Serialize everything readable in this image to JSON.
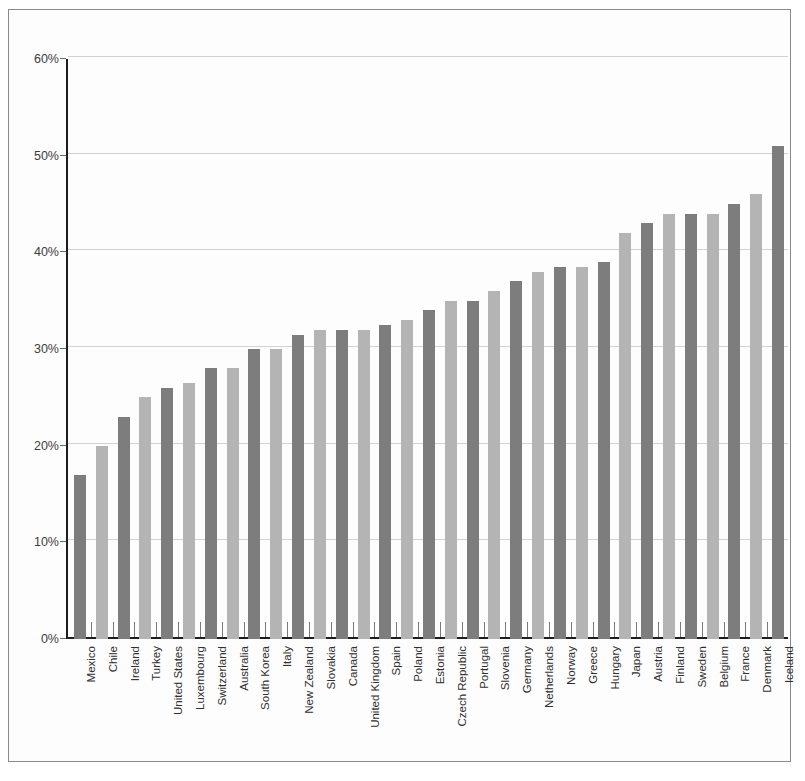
{
  "chart_data": {
    "type": "bar",
    "title": "",
    "subtitle": "",
    "xlabel": "",
    "ylabel": "",
    "ylim": [
      0,
      60
    ],
    "y_tick_labels": [
      "0%",
      "10%",
      "20%",
      "30%",
      "40%",
      "50%",
      "60%"
    ],
    "y_ticks": [
      0,
      10,
      20,
      30,
      40,
      50,
      60
    ],
    "grid": true,
    "legend": "none",
    "value_suffix": "%",
    "bar_colors": {
      "dark": "#7d7d7d",
      "light": "#b4b4b4"
    },
    "categories": [
      "Mexico",
      "Chile",
      "Ireland",
      "Turkey",
      "United States",
      "Luxembourg",
      "Switzerland",
      "Australia",
      "South Korea",
      "Italy",
      "New Zealand",
      "Slovakia",
      "Canada",
      "United Kingdom",
      "Spain",
      "Poland",
      "Estonia",
      "Czech Republic",
      "Portugal",
      "Slovenia",
      "Germany",
      "Netherlands",
      "Norway",
      "Greece",
      "Hungary",
      "Japan",
      "Austria",
      "Finland",
      "Sweden",
      "Belgium",
      "France",
      "Denmark",
      "Iceland"
    ],
    "values": [
      17,
      20,
      23,
      25,
      26,
      26.5,
      28,
      28,
      30,
      30,
      31.5,
      32,
      32,
      32,
      32.5,
      33,
      34,
      35,
      35,
      36,
      37,
      38,
      38.5,
      38.5,
      39,
      42,
      43,
      44,
      44,
      44,
      45,
      46,
      51
    ]
  }
}
